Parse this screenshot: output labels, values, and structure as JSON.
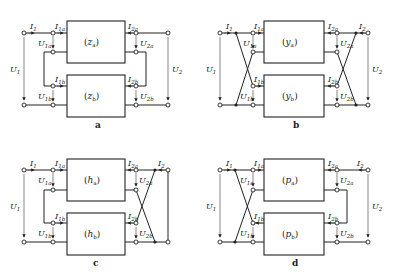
{
  "figure": {
    "panels": [
      {
        "id": "a",
        "caption": "a",
        "box_top": "(z_a)",
        "box_bottom": "(z_b)",
        "box_top_sym": "z",
        "box_top_sub": "a",
        "box_bottom_sym": "z",
        "box_bottom_sub": "b",
        "connection": "series-series",
        "labels": {
          "I1": "I",
          "I1s": "1",
          "I1a": "I",
          "I1as": "1a",
          "I1b": "I",
          "I1bs": "1b",
          "I2a": "I",
          "I2as": "2a",
          "I2b": "I",
          "I2bs": "2b",
          "I2": "",
          "I2s": "",
          "U1": "U",
          "U1s": "1",
          "U1a": "U",
          "U1as": "1a",
          "U1b": "U",
          "U1bs": "1b",
          "U2a": "U",
          "U2as": "2a",
          "U2b": "U",
          "U2bs": "2b",
          "U2": "U",
          "U2s": "2"
        }
      },
      {
        "id": "b",
        "caption": "b",
        "box_top": "(y_a)",
        "box_bottom": "(y_b)",
        "box_top_sym": "y",
        "box_top_sub": "a",
        "box_bottom_sym": "y",
        "box_bottom_sub": "b",
        "connection": "parallel-parallel",
        "labels": {
          "I1": "I",
          "I1s": "1",
          "I1a": "I",
          "I1as": "1a",
          "I1b": "I",
          "I1bs": "1b",
          "I2a": "I",
          "I2as": "2a",
          "I2b": "I",
          "I2bs": "2b",
          "I2": "I",
          "I2s": "2",
          "U1": "U",
          "U1s": "1",
          "U1a": "U",
          "U1as": "1a",
          "U1b": "U",
          "U1bs": "1b",
          "U2a": "U",
          "U2as": "2a",
          "U2b": "U",
          "U2bs": "2b",
          "U2": "U",
          "U2s": "2"
        }
      },
      {
        "id": "c",
        "caption": "c",
        "box_top": "(h_a)",
        "box_bottom": "(h_b)",
        "box_top_sym": "h",
        "box_top_sub": "a",
        "box_bottom_sym": "h",
        "box_bottom_sub": "b",
        "connection": "series-parallel",
        "labels": {
          "I1": "I",
          "I1s": "1",
          "I1a": "I",
          "I1as": "1a",
          "I1b": "I",
          "I1bs": "1b",
          "I2a": "I",
          "I2as": "2a",
          "I2b": "I",
          "I2bs": "2b",
          "I2": "I",
          "I2s": "2",
          "U1": "U",
          "U1s": "1",
          "U1a": "U",
          "U1as": "1a",
          "U1b": "U",
          "U1bs": "1b",
          "U2a": "U",
          "U2as": "2a",
          "U2b": "U",
          "U2bs": "2b",
          "U2": "",
          "U2s": ""
        }
      },
      {
        "id": "d",
        "caption": "d",
        "box_top": "(p_a)",
        "box_bottom": "(p_b)",
        "box_top_sym": "p",
        "box_top_sub": "a",
        "box_bottom_sym": "p",
        "box_bottom_sub": "b",
        "connection": "parallel-series",
        "labels": {
          "I1": "I",
          "I1s": "1",
          "I1a": "I",
          "I1as": "1a",
          "I1b": "I",
          "I1bs": "1b",
          "I2a": "I",
          "I2as": "2a",
          "I2b": "I",
          "I2bs": "2b",
          "I2": "I",
          "I2s": "2",
          "U1": "U",
          "U1s": "1",
          "U1a": "U",
          "U1as": "1a",
          "U1b": "U",
          "U1bs": "1b",
          "U2a": "U",
          "U2as": "2a",
          "U2b": "U",
          "U2bs": "2b",
          "U2": "U",
          "U2s": "2"
        }
      }
    ]
  }
}
